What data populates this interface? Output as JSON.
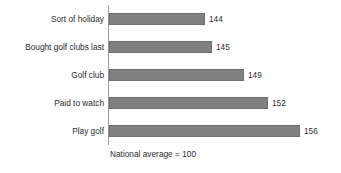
{
  "chart_data": {
    "type": "bar",
    "orientation": "horizontal",
    "title": "",
    "xlabel": "",
    "ylabel": "",
    "categories": [
      "Sort of holiday",
      "Bought golf clubs last",
      "Golf club",
      "Paid to watch",
      "Play golf"
    ],
    "values": [
      144,
      145,
      149,
      152,
      156
    ],
    "value_labels": [
      "144",
      "145",
      "149",
      "152",
      "156"
    ],
    "annotation": "National average = 100",
    "baseline": 100,
    "xlim": [
      132,
      156
    ],
    "grid": false,
    "legend": false,
    "bar_color": "#808080",
    "bar_border_color": "#6e6e6e",
    "axis_color": "#9a9a9a",
    "text_color": "#2b2b2b",
    "background": "#ffffff"
  }
}
